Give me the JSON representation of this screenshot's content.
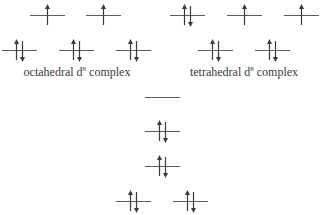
{
  "diagram": {
    "colors": {
      "line": "#5a5a5a",
      "arrow": "#3a3a3a",
      "text": "#3a3a3a"
    },
    "octahedral": {
      "label_prefix": "octahedral d",
      "label_sup": "8",
      "label_suffix": " complex",
      "levels": [
        {
          "id": "oct-upper-1",
          "x": 30,
          "y": 3,
          "electrons": "up"
        },
        {
          "id": "oct-upper-2",
          "x": 86,
          "y": 3,
          "electrons": "up"
        },
        {
          "id": "oct-lower-1",
          "x": 2,
          "y": 38,
          "electrons": "pair"
        },
        {
          "id": "oct-lower-2",
          "x": 59,
          "y": 38,
          "electrons": "pair"
        },
        {
          "id": "oct-lower-3",
          "x": 116,
          "y": 38,
          "electrons": "pair"
        }
      ]
    },
    "tetrahedral": {
      "label_prefix": "tetrahedral d",
      "label_sup": "8",
      "label_suffix": " complex",
      "levels": [
        {
          "id": "tet-upper-1",
          "x": 170,
          "y": 3,
          "electrons": "pair"
        },
        {
          "id": "tet-upper-2",
          "x": 227,
          "y": 3,
          "electrons": "up"
        },
        {
          "id": "tet-upper-3",
          "x": 284,
          "y": 3,
          "electrons": "up"
        },
        {
          "id": "tet-lower-1",
          "x": 198,
          "y": 38,
          "electrons": "pair"
        },
        {
          "id": "tet-lower-2",
          "x": 255,
          "y": 38,
          "electrons": "pair"
        }
      ]
    },
    "square_planar": {
      "levels": [
        {
          "id": "sp-level-1",
          "x": 145,
          "y": 85,
          "electrons": "empty"
        },
        {
          "id": "sp-level-2",
          "x": 145,
          "y": 119,
          "electrons": "pair"
        },
        {
          "id": "sp-level-3",
          "x": 145,
          "y": 154,
          "electrons": "pair"
        },
        {
          "id": "sp-level-4a",
          "x": 116,
          "y": 189,
          "electrons": "pair"
        },
        {
          "id": "sp-level-4b",
          "x": 173,
          "y": 189,
          "electrons": "pair"
        }
      ]
    }
  }
}
